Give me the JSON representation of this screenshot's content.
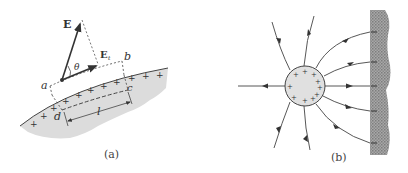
{
  "figure": {
    "panel_a": {
      "caption": "(a)",
      "labels": {
        "E": "E",
        "E_t_main": "E",
        "E_t_sub": "t",
        "theta": "θ",
        "a": "a",
        "b": "b",
        "c": "c",
        "d": "d",
        "l": "l"
      },
      "surface_charge_symbol": "+"
    },
    "panel_b": {
      "caption": "(b)",
      "sphere_charge_symbol": "+",
      "wall_charge_symbol": "−"
    },
    "colors": {
      "line": "#444444",
      "conductor_fill": "#d9d9d9",
      "wall_fill": "#9a9a9a",
      "background": "#ffffff"
    }
  }
}
